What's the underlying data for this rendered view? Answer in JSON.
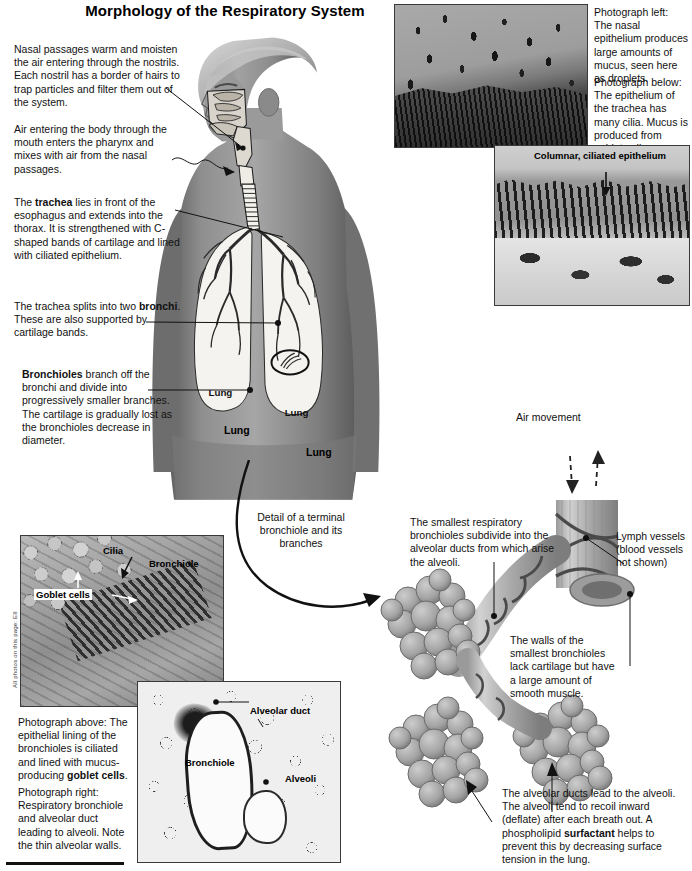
{
  "page": {
    "title": "Morphology of the Respiratory System",
    "credit": "All photos on this page: EII"
  },
  "left_column": {
    "nasal_passages": "Nasal passages warm and moisten the air entering through the nostrils. Each nostril has a border of hairs to trap particles and filter them out of the system.",
    "mouth_air": "Air entering the body through the mouth enters the pharynx and mixes with air from the nasal passages.",
    "trachea_pre": "The ",
    "trachea_bold": "trachea",
    "trachea_post": " lies in front of the esophagus and extends into the thorax. It is strengthened with C-shaped bands of cartilage and lined with ciliated epithelium.",
    "bronchi_pre": "The trachea splits into two ",
    "bronchi_bold": "bronchi",
    "bronchi_post": ". These are also supported by cartilage bands.",
    "bronchioles_bold": "Bronchioles",
    "bronchioles_post": " branch off the bronchi and divide into progressively smaller branches. The cartilage is gradually lost as the bronchioles decrease in diameter."
  },
  "figure_labels": {
    "lung_left": "Lung",
    "lung_right": "Lung",
    "detail_callout": "Detail of a terminal bronchiole and its branches"
  },
  "top_right_captions": {
    "photo_left": "Photograph left: The nasal epithelium produces large amounts of mucus, seen here as droplets.",
    "photo_below": "Photograph below: The epithelium of the trachea has many cilia. Mucus is produced from goblet cells."
  },
  "micrograph_labels": {
    "columnar": "Columnar, ciliated epithelium",
    "cilia": "Cilia",
    "bronchiole_top": "Bronchiole",
    "goblet_cells": "Goblet cells",
    "alveolar_duct": "Alveolar duct",
    "bronchiole_lower": "Bronchiole",
    "alveoli": "Alveoli"
  },
  "bottom_left_captions": {
    "above_pre": "Photograph above: The epithelial lining of the bronchioles is ciliated and lined with mucus-producing ",
    "above_bold": "goblet cells",
    "above_post": ".",
    "right": "Photograph right: Respiratory bronchiole and alveolar duct leading to alveoli. Note the thin alveolar walls."
  },
  "alveoli_diagram": {
    "air_movement": "Air movement",
    "smallest_bronchioles": "The smallest respiratory bronchioles subdivide into the alveolar ducts from which arise the alveoli.",
    "lymph_vessels": "Lymph vessels (blood vessels not shown)",
    "walls": "The walls of the smallest bronchioles lack cartilage but have a large amount of smooth muscle.",
    "ducts_pre": "The alveolar ducts lead to the alveoli. The alveoli tend to recoil inward (deflate) after each breath out. A phospholipid ",
    "ducts_bold": "surfactant",
    "ducts_post": " helps to prevent this by decreasing surface tension in the lung."
  },
  "colors": {
    "ink": "#111111",
    "skin": "#8d8d8d",
    "lung_fill": "#f2f2f0",
    "frame": "#3a3a3a"
  }
}
